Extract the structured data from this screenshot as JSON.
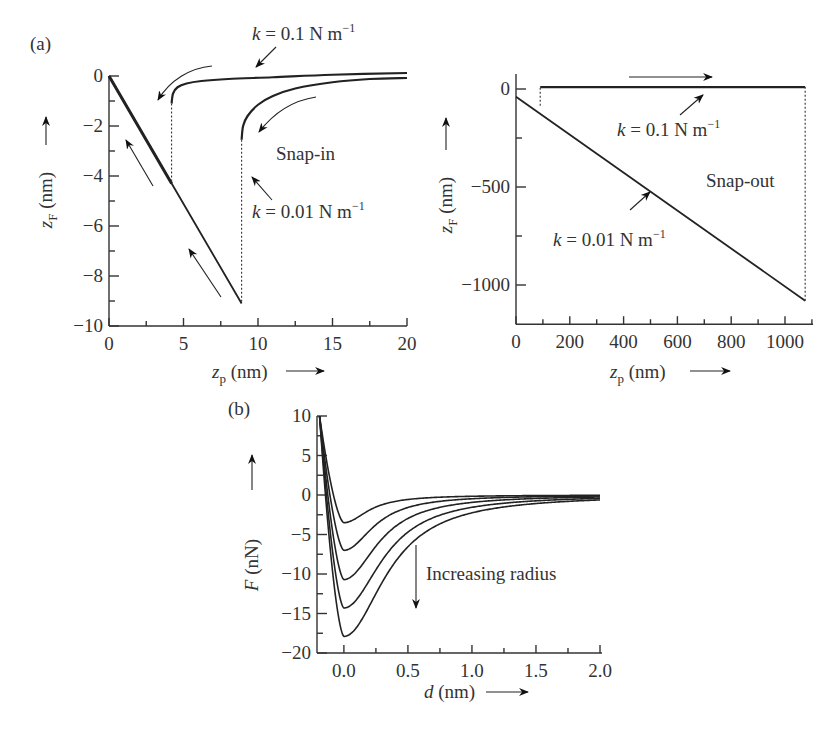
{
  "figure": {
    "panel_labels": [
      "(a)",
      "(b)"
    ]
  },
  "chart_data": [
    {
      "id": "a-left",
      "type": "line",
      "title": "Snap-in",
      "panel": "(a)",
      "xlabel": "z_p (nm)",
      "ylabel": "z_F (nm)",
      "xlim": [
        0,
        20
      ],
      "ylim": [
        -10,
        0.5
      ],
      "xticks": [
        0,
        5,
        10,
        15,
        20
      ],
      "xtick_labels": [
        "0",
        "5",
        "10",
        "15",
        "20"
      ],
      "yticks": [
        0,
        -2,
        -4,
        -6,
        -8,
        -10
      ],
      "ytick_labels": [
        "0",
        "−2",
        "−4",
        "−6",
        "−8",
        "−10"
      ],
      "grid": false,
      "series": [
        {
          "name": "k = 0.1 N m⁻¹ approach",
          "x": [
            4.2,
            4.3,
            4.6,
            5.2,
            6.2,
            8,
            11,
            15,
            20
          ],
          "y": [
            -1.1,
            -0.7,
            -0.45,
            -0.3,
            -0.2,
            -0.12,
            -0.05,
            0.05,
            0.12
          ]
        },
        {
          "name": "k = 0.01 N m⁻¹ approach",
          "x": [
            8.9,
            9.0,
            9.3,
            10,
            11,
            12.5,
            15,
            17.5,
            20
          ],
          "y": [
            -2.55,
            -2.0,
            -1.6,
            -1.15,
            -0.8,
            -0.5,
            -0.25,
            -0.12,
            -0.08
          ]
        },
        {
          "name": "contact line",
          "x": [
            0,
            8.9
          ],
          "y": [
            0,
            -9.1
          ]
        }
      ],
      "snap_jumps": [
        {
          "name": "k = 0.1 N m⁻¹",
          "x": 4.2,
          "y_from": -1.1,
          "y_to": -4.3
        },
        {
          "name": "k = 0.01 N m⁻¹",
          "x": 8.9,
          "y_from": -2.55,
          "y_to": -9.1
        }
      ],
      "annotations": [
        "k = 0.1  N m⁻¹",
        "k = 0.01  N m⁻¹",
        "Snap-in"
      ]
    },
    {
      "id": "a-right",
      "type": "line",
      "title": "Snap-out",
      "panel": "(a)",
      "xlabel": "z_p (nm)",
      "ylabel": "z_F (nm)",
      "xlim": [
        0,
        1080
      ],
      "ylim": [
        -1200,
        50
      ],
      "xticks": [
        0,
        200,
        400,
        600,
        800,
        1000
      ],
      "xtick_labels": [
        "0",
        "200",
        "400",
        "600",
        "800",
        "1000"
      ],
      "yticks": [
        0,
        -500,
        -1000
      ],
      "ytick_labels": [
        "0",
        "−500",
        "−1000"
      ],
      "grid": false,
      "series": [
        {
          "name": "k = 0.1 N m⁻¹",
          "x": [
            90,
            1075
          ],
          "y": [
            10,
            10
          ]
        },
        {
          "name": "k = 0.01 N m⁻¹",
          "x": [
            0,
            1075
          ],
          "y": [
            -40,
            -1080
          ]
        }
      ],
      "snap_jumps": [
        {
          "name": "k = 0.1 N m⁻¹",
          "x": 90,
          "y_from": -85,
          "y_to": 10
        },
        {
          "name": "k = 0.01 N m⁻¹",
          "x": 1075,
          "y_from": -1080,
          "y_to": 10
        }
      ],
      "annotations": [
        "k = 0.1  N m⁻¹",
        "k = 0.01  N m⁻¹",
        "Snap-out"
      ]
    },
    {
      "id": "b",
      "type": "line",
      "title": "",
      "panel": "(b)",
      "xlabel": "d (nm)",
      "ylabel": "F (nN)",
      "xlim": [
        -0.21,
        2.0
      ],
      "ylim": [
        -20,
        10
      ],
      "xticks": [
        0.0,
        0.5,
        1.0,
        1.5,
        2.0
      ],
      "xtick_labels": [
        "0.0",
        "0.5",
        "1.0",
        "1.5",
        "2.0"
      ],
      "yticks": [
        10,
        5,
        0,
        -5,
        -10,
        -15,
        -20
      ],
      "ytick_labels": [
        "10",
        "5",
        "0",
        "−5",
        "−10",
        "−15",
        "−20"
      ],
      "grid": false,
      "series": [
        {
          "name": "radius 1",
          "min_d": 0.0,
          "min_F": -3.5,
          "width": 0.22
        },
        {
          "name": "radius 2",
          "min_d": 0.0,
          "min_F": -7.0,
          "width": 0.27
        },
        {
          "name": "radius 3",
          "min_d": 0.0,
          "min_F": -10.7,
          "width": 0.31
        },
        {
          "name": "radius 4",
          "min_d": 0.0,
          "min_F": -14.3,
          "width": 0.35
        },
        {
          "name": "radius 5",
          "min_d": 0.0,
          "min_F": -17.9,
          "width": 0.38
        }
      ],
      "annotations": [
        "Increasing radius"
      ]
    }
  ],
  "labels": {
    "a_left_xlabel_var": "z",
    "a_left_xlabel_sub": "p",
    "a_left_xlabel_unit": " (nm)",
    "a_left_ylabel_var": "z",
    "a_left_ylabel_sub": "F",
    "a_left_ylabel_unit": " (nm)",
    "a_right_xlabel_var": "z",
    "a_right_xlabel_sub": "p",
    "a_right_xlabel_unit": " (nm)",
    "a_right_ylabel_var": "z",
    "a_right_ylabel_sub": "F",
    "a_right_ylabel_unit": " (nm)",
    "b_xlabel_var": "d",
    "b_xlabel_unit": " (nm)",
    "b_ylabel_var": "F",
    "b_ylabel_unit": " (nN)",
    "k01": "k = 0.1  N m",
    "k001": "k = 0.01  N m",
    "exp": "−1",
    "snap_in": "Snap-in",
    "snap_out": "Snap-out",
    "increasing_radius": "Increasing radius"
  }
}
